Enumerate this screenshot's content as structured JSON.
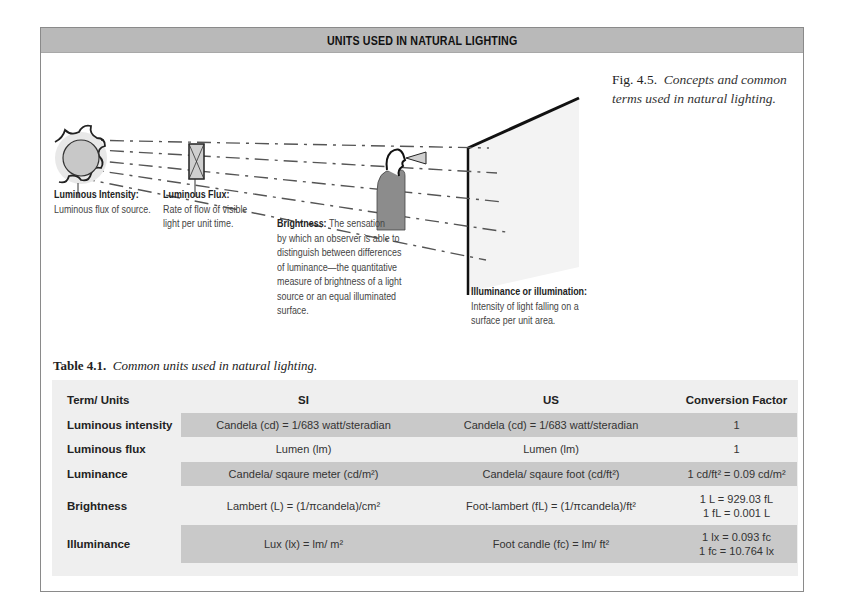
{
  "banner": {
    "title": "UNITS USED IN NATURAL LIGHTING"
  },
  "figure": {
    "caption_label": "Fig. 4.5.",
    "caption_text": "Concepts and common terms used in natural lighting.",
    "labels": {
      "intensity": {
        "heading": "Luminous Intensity:",
        "body": "Luminous flux of source."
      },
      "flux": {
        "heading": "Luminous Flux:",
        "body_lines": [
          "Rate of flow of visible",
          "light per unit time."
        ]
      },
      "brightness": {
        "heading": "Brightness:",
        "body_lines": [
          "The sensation",
          "by which an observer is able to",
          "distinguish between differences",
          "of luminance—the quantitative",
          "measure of brightness of a light",
          "source or an equal illuminated",
          "surface."
        ]
      },
      "illuminance": {
        "heading": "Illuminance or illumination:",
        "body_lines": [
          "Intensity of light falling on a",
          "surface per unit area."
        ]
      }
    },
    "elements": [
      "sun-icon",
      "flux-window-icon",
      "observer-icon",
      "eye-cone-icon",
      "illuminated-surface-wall",
      "light-rays"
    ]
  },
  "table": {
    "caption_label": "Table 4.1.",
    "caption_text": "Common units used in natural lighting.",
    "headers": {
      "term": "Term/ Units",
      "si": "SI",
      "us": "US",
      "cf": "Conversion Factor"
    },
    "rows": [
      {
        "term": "Luminous intensity",
        "si": "Candela (cd) = 1/683 watt/steradian",
        "us": "Candela (cd) = 1/683 watt/steradian",
        "cf": [
          "1"
        ]
      },
      {
        "term": "Luminous flux",
        "si": "Lumen (lm)",
        "us": "Lumen (lm)",
        "cf": [
          "1"
        ]
      },
      {
        "term": "Luminance",
        "si": "Candela/ sqaure meter (cd/m²)",
        "us": "Candela/ sqaure foot (cd/ft²)",
        "cf": [
          "1 cd/ft² = 0.09 cd/m²"
        ]
      },
      {
        "term": "Brightness",
        "si": "Lambert (L) = (1/πcandela)/cm²",
        "us": "Foot-lambert (fL) = (1/πcandela)/ft²",
        "cf": [
          "1 L = 929.03 fL",
          "1 fL = 0.001 L"
        ]
      },
      {
        "term": "Illuminance",
        "si": "Lux (lx) = lm/ m²",
        "us": "Foot candle (fc) = lm/ ft²",
        "cf": [
          "1 lx = 0.093 fc",
          "1 fc = 10.764 lx"
        ]
      }
    ]
  },
  "colors": {
    "banner_bg": "#b9b9b9",
    "table_bg": "#efefef",
    "row_dark": "#c9c9c9",
    "frame_border": "#8a8a8a"
  }
}
